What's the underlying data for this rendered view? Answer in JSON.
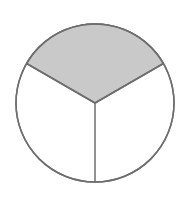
{
  "figure": {
    "description": "Circle divided into three equal sectors with one sector shaded",
    "shape": "circle",
    "center": [
      95,
      103
    ],
    "radius": 79,
    "sectors_total": 3,
    "sectors_shaded": 1,
    "shaded_fraction": "1/3",
    "colors": {
      "shaded_fill": "#c9c9c9",
      "unshaded_fill": "#ffffff",
      "stroke": "#6e6e6e",
      "background": "#ffffff"
    },
    "sectors": [
      {
        "name": "top",
        "shaded": true,
        "start_point": [
          26.6,
          63.5
        ],
        "end_point": [
          163.4,
          63.5
        ]
      },
      {
        "name": "bottom-right",
        "shaded": false,
        "start_point": [
          163.4,
          63.5
        ],
        "end_point": [
          95,
          182
        ]
      },
      {
        "name": "bottom-left",
        "shaded": false,
        "start_point": [
          95,
          182
        ],
        "end_point": [
          26.6,
          63.5
        ]
      }
    ]
  }
}
